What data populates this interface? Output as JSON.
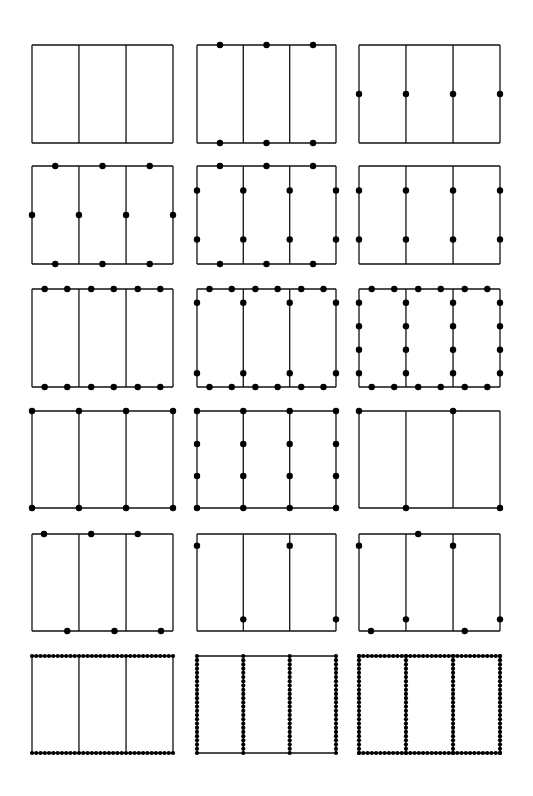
{
  "figure": {
    "stroke_color": "#111111",
    "dot_color": "#000000",
    "background": "#ffffff",
    "rows": [
      {
        "top": 45,
        "height": 98
      },
      {
        "top": 166,
        "height": 98
      },
      {
        "top": 289,
        "height": 98
      },
      {
        "top": 411,
        "height": 97
      },
      {
        "top": 534,
        "height": 97
      },
      {
        "top": 656,
        "height": 97
      }
    ],
    "columns": [
      {
        "left": 32,
        "width": 141
      },
      {
        "left": 197,
        "width": 139
      },
      {
        "left": 359,
        "width": 141
      }
    ],
    "dividers": [
      0.333,
      0.667
    ],
    "panels": [
      {
        "id": "r1c1",
        "row": 0,
        "col": 0,
        "dots": []
      },
      {
        "id": "r1c2",
        "row": 0,
        "col": 1,
        "dots": [
          [
            0.165,
            0
          ],
          [
            0.5,
            0
          ],
          [
            0.835,
            0
          ],
          [
            0.165,
            1
          ],
          [
            0.5,
            1
          ],
          [
            0.835,
            1
          ]
        ]
      },
      {
        "id": "r1c3",
        "row": 0,
        "col": 2,
        "dots": [
          [
            0,
            0.5
          ],
          [
            0.333,
            0.5
          ],
          [
            0.667,
            0.5
          ],
          [
            1,
            0.5
          ]
        ]
      },
      {
        "id": "r2c1",
        "row": 1,
        "col": 0,
        "dots": [
          [
            0.165,
            0
          ],
          [
            0.5,
            0
          ],
          [
            0.835,
            0
          ],
          [
            0,
            0.5
          ],
          [
            0.333,
            0.5
          ],
          [
            0.667,
            0.5
          ],
          [
            1,
            0.5
          ],
          [
            0.165,
            1
          ],
          [
            0.5,
            1
          ],
          [
            0.835,
            1
          ]
        ]
      },
      {
        "id": "r2c2",
        "row": 1,
        "col": 1,
        "dots": [
          [
            0.165,
            0
          ],
          [
            0.5,
            0
          ],
          [
            0.835,
            0
          ],
          [
            0,
            0.25
          ],
          [
            0.333,
            0.25
          ],
          [
            0.667,
            0.25
          ],
          [
            1,
            0.25
          ],
          [
            0,
            0.75
          ],
          [
            0.333,
            0.75
          ],
          [
            0.667,
            0.75
          ],
          [
            1,
            0.75
          ],
          [
            0.165,
            1
          ],
          [
            0.5,
            1
          ],
          [
            0.835,
            1
          ]
        ]
      },
      {
        "id": "r2c3",
        "row": 1,
        "col": 2,
        "dots": [
          [
            0,
            0.25
          ],
          [
            0.333,
            0.25
          ],
          [
            0.667,
            0.25
          ],
          [
            1,
            0.25
          ],
          [
            0,
            0.75
          ],
          [
            0.333,
            0.75
          ],
          [
            0.667,
            0.75
          ],
          [
            1,
            0.75
          ]
        ]
      },
      {
        "id": "r3c1",
        "row": 2,
        "col": 0,
        "dots": [
          [
            0.09,
            0
          ],
          [
            0.25,
            0
          ],
          [
            0.42,
            0
          ],
          [
            0.58,
            0
          ],
          [
            0.75,
            0
          ],
          [
            0.91,
            0
          ],
          [
            0.09,
            1
          ],
          [
            0.25,
            1
          ],
          [
            0.42,
            1
          ],
          [
            0.58,
            1
          ],
          [
            0.75,
            1
          ],
          [
            0.91,
            1
          ]
        ]
      },
      {
        "id": "r3c2",
        "row": 2,
        "col": 1,
        "dots": [
          [
            0.09,
            0
          ],
          [
            0.25,
            0
          ],
          [
            0.42,
            0
          ],
          [
            0.58,
            0
          ],
          [
            0.75,
            0
          ],
          [
            0.91,
            0
          ],
          [
            0,
            0.14
          ],
          [
            0.333,
            0.14
          ],
          [
            0.667,
            0.14
          ],
          [
            1,
            0.14
          ],
          [
            0,
            0.86
          ],
          [
            0.333,
            0.86
          ],
          [
            0.667,
            0.86
          ],
          [
            1,
            0.86
          ],
          [
            0.09,
            1
          ],
          [
            0.25,
            1
          ],
          [
            0.42,
            1
          ],
          [
            0.58,
            1
          ],
          [
            0.75,
            1
          ],
          [
            0.91,
            1
          ]
        ]
      },
      {
        "id": "r3c3",
        "row": 2,
        "col": 2,
        "dots": [
          [
            0.09,
            0
          ],
          [
            0.25,
            0
          ],
          [
            0.42,
            0
          ],
          [
            0.58,
            0
          ],
          [
            0.75,
            0
          ],
          [
            0.91,
            0
          ],
          [
            0,
            0.14
          ],
          [
            0.333,
            0.14
          ],
          [
            0.667,
            0.14
          ],
          [
            1,
            0.14
          ],
          [
            0,
            0.38
          ],
          [
            0.333,
            0.38
          ],
          [
            0.667,
            0.38
          ],
          [
            1,
            0.38
          ],
          [
            0,
            0.62
          ],
          [
            0.333,
            0.62
          ],
          [
            0.667,
            0.62
          ],
          [
            1,
            0.62
          ],
          [
            0,
            0.86
          ],
          [
            0.333,
            0.86
          ],
          [
            0.667,
            0.86
          ],
          [
            1,
            0.86
          ],
          [
            0.09,
            1
          ],
          [
            0.25,
            1
          ],
          [
            0.42,
            1
          ],
          [
            0.58,
            1
          ],
          [
            0.75,
            1
          ],
          [
            0.91,
            1
          ]
        ]
      },
      {
        "id": "r4c1",
        "row": 3,
        "col": 0,
        "dots": [
          [
            0,
            0
          ],
          [
            0.333,
            0
          ],
          [
            0.667,
            0
          ],
          [
            1,
            0
          ],
          [
            0,
            1
          ],
          [
            0.333,
            1
          ],
          [
            0.667,
            1
          ],
          [
            1,
            1
          ]
        ]
      },
      {
        "id": "r4c2",
        "row": 3,
        "col": 1,
        "dots": [
          [
            0,
            0
          ],
          [
            0.333,
            0
          ],
          [
            0.667,
            0
          ],
          [
            1,
            0
          ],
          [
            0,
            0.34
          ],
          [
            0.333,
            0.34
          ],
          [
            0.667,
            0.34
          ],
          [
            1,
            0.34
          ],
          [
            0,
            0.67
          ],
          [
            0.333,
            0.67
          ],
          [
            0.667,
            0.67
          ],
          [
            1,
            0.67
          ],
          [
            0,
            1
          ],
          [
            0.333,
            1
          ],
          [
            0.667,
            1
          ],
          [
            1,
            1
          ]
        ]
      },
      {
        "id": "r4c3",
        "row": 3,
        "col": 2,
        "dots": [
          [
            0,
            0
          ],
          [
            0.667,
            0
          ],
          [
            0.333,
            1
          ],
          [
            1,
            1
          ]
        ]
      },
      {
        "id": "r5c1",
        "row": 4,
        "col": 0,
        "dots": [
          [
            0.085,
            0
          ],
          [
            0.42,
            0
          ],
          [
            0.75,
            0
          ],
          [
            0.25,
            1
          ],
          [
            0.585,
            1
          ],
          [
            0.915,
            1
          ]
        ]
      },
      {
        "id": "r5c2",
        "row": 4,
        "col": 1,
        "dots": [
          [
            0,
            0.12
          ],
          [
            0.667,
            0.12
          ],
          [
            0.333,
            0.88
          ],
          [
            1,
            0.88
          ]
        ]
      },
      {
        "id": "r5c3",
        "row": 4,
        "col": 2,
        "dots": [
          [
            0.42,
            0
          ],
          [
            0,
            0.12
          ],
          [
            0.667,
            0.12
          ],
          [
            0.333,
            0.88
          ],
          [
            1,
            0.88
          ],
          [
            0.085,
            1
          ],
          [
            0.75,
            1
          ]
        ]
      },
      {
        "id": "r6c1",
        "row": 5,
        "col": 0,
        "dense": {
          "top": true,
          "bottom": true,
          "verticals": false
        },
        "dots": []
      },
      {
        "id": "r6c2",
        "row": 5,
        "col": 1,
        "dense": {
          "top": false,
          "bottom": false,
          "verticals": true
        },
        "dots": []
      },
      {
        "id": "r6c3",
        "row": 5,
        "col": 2,
        "dense": {
          "top": true,
          "bottom": true,
          "verticals": true
        },
        "dots": []
      }
    ],
    "dot_radius": 3.2,
    "dense_dot_radius": 2.1,
    "dense_spacing": 4.3
  }
}
